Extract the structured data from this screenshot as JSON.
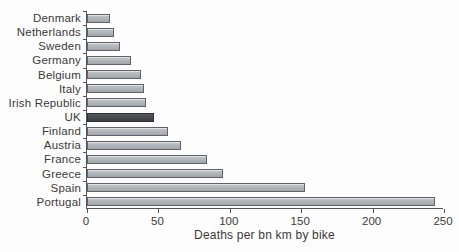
{
  "chart_data": {
    "type": "bar",
    "orientation": "horizontal",
    "title": "",
    "xlabel": "Deaths per bn km by bike",
    "ylabel": "",
    "categories": [
      "Denmark",
      "Netherlands",
      "Sweden",
      "Germany",
      "Belgium",
      "Italy",
      "Irish Republic",
      "UK",
      "Finland",
      "Austria",
      "France",
      "Greece",
      "Spain",
      "Portugal"
    ],
    "values": [
      16,
      19,
      23,
      31,
      38,
      40,
      41,
      47,
      57,
      66,
      84,
      95,
      153,
      244
    ],
    "xlim": [
      0,
      250
    ],
    "xticks": [
      0,
      50,
      100,
      150,
      200,
      250
    ],
    "grid": false,
    "legend": "none",
    "highlighted_category": "UK",
    "colors": {
      "bar_fill": "#b3b6ba",
      "bar_border": "#5f6266",
      "highlight_fill": "#474a4e",
      "highlight_border": "#2e3134",
      "axis": "#555555",
      "text": "#3a3a3a",
      "background": "#fdfdfd"
    }
  }
}
